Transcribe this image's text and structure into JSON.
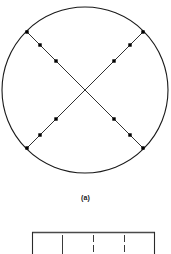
{
  "figure": {
    "caption_a": "(a)",
    "background_color": "#ffffff",
    "stroke_color": "#1a1a1a",
    "marker_color": "#000000"
  },
  "panel_a": {
    "name": "circular-diffraction-pattern",
    "circle": {
      "center_x": 85,
      "center_y": 90,
      "radius": 83,
      "stroke_width": 1.1
    },
    "lines": [
      {
        "name": "diagonal-line-nw-se",
        "x1": 27,
        "y1": 32,
        "x2": 143,
        "y2": 148,
        "stroke_width": 0.9
      },
      {
        "name": "diagonal-line-ne-sw",
        "x1": 143,
        "y1": 32,
        "x2": 27,
        "y2": 148,
        "stroke_width": 0.9
      }
    ],
    "markers": {
      "shape": "square",
      "size": 3.4,
      "points": [
        {
          "x": 27,
          "y": 32
        },
        {
          "x": 40,
          "y": 45
        },
        {
          "x": 56,
          "y": 61
        },
        {
          "x": 114,
          "y": 119
        },
        {
          "x": 130,
          "y": 135
        },
        {
          "x": 143,
          "y": 148
        },
        {
          "x": 143,
          "y": 32
        },
        {
          "x": 130,
          "y": 45
        },
        {
          "x": 114,
          "y": 61
        },
        {
          "x": 56,
          "y": 119
        },
        {
          "x": 40,
          "y": 135
        },
        {
          "x": 27,
          "y": 148
        }
      ]
    }
  },
  "panel_b": {
    "name": "framed-scale-panel",
    "frame": {
      "left": 32,
      "right": 155,
      "top": 4,
      "stroke_width": 1.1
    },
    "ticks": [
      {
        "x": 32,
        "kind": "border"
      },
      {
        "x": 62,
        "kind": "divider"
      },
      {
        "x": 93,
        "kind": "divider"
      },
      {
        "x": 124,
        "kind": "divider"
      },
      {
        "x": 155,
        "kind": "border"
      }
    ]
  }
}
